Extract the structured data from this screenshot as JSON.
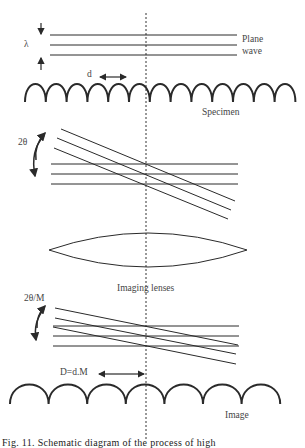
{
  "labels": {
    "lambda": "λ",
    "plane_wave_line1": "Plane",
    "plane_wave_line2": "wave",
    "d": "d",
    "specimen": "Specimen",
    "two_theta": "2θ",
    "imaging_lenses": "Imaging lenses",
    "two_theta_over_m": "2θ/M",
    "D_equals": "D=d.M",
    "image": "Image"
  },
  "caption": "Fig. 11.  Schematic diagram of the process of high",
  "colors": {
    "stroke": "#2a2a2a",
    "text": "#444444",
    "background": "#ffffff"
  }
}
